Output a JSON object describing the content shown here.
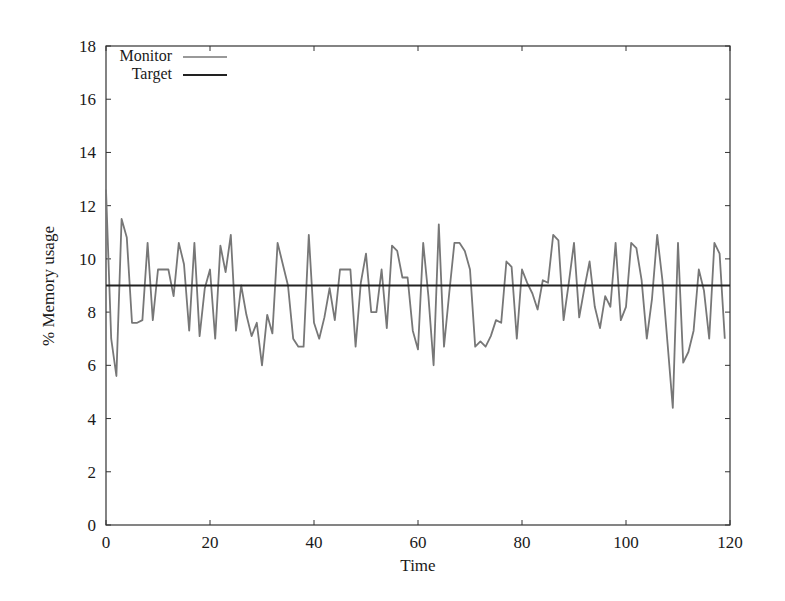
{
  "chart_data": {
    "type": "line",
    "title": "",
    "xlabel": "Time",
    "ylabel": "% Memory usage",
    "xlim": [
      0,
      120
    ],
    "ylim": [
      0,
      18
    ],
    "xticks": [
      0,
      20,
      40,
      60,
      80,
      100,
      120
    ],
    "yticks": [
      0,
      2,
      4,
      6,
      8,
      10,
      12,
      14,
      16,
      18
    ],
    "grid": false,
    "legend_position": "top-left",
    "series": [
      {
        "name": "Monitor",
        "color": "#777777",
        "x": [
          0,
          1,
          2,
          3,
          4,
          5,
          6,
          7,
          8,
          9,
          10,
          11,
          12,
          13,
          14,
          15,
          16,
          17,
          18,
          19,
          20,
          21,
          22,
          23,
          24,
          25,
          26,
          27,
          28,
          29,
          30,
          31,
          32,
          33,
          34,
          35,
          36,
          37,
          38,
          39,
          40,
          41,
          42,
          43,
          44,
          45,
          46,
          47,
          48,
          49,
          50,
          51,
          52,
          53,
          54,
          55,
          56,
          57,
          58,
          59,
          60,
          61,
          62,
          63,
          64,
          65,
          66,
          67,
          68,
          69,
          70,
          71,
          72,
          73,
          74,
          75,
          76,
          77,
          78,
          79,
          80,
          81,
          82,
          83,
          84,
          85,
          86,
          87,
          88,
          89,
          90,
          91,
          92,
          93,
          94,
          95,
          96,
          97,
          98,
          99,
          100,
          101,
          102,
          103,
          104,
          105,
          106,
          107,
          108,
          109,
          110,
          111,
          112,
          113,
          114,
          115,
          116,
          117,
          118,
          119
        ],
        "values": [
          12.6,
          7.0,
          5.6,
          11.5,
          10.8,
          7.6,
          7.6,
          7.7,
          10.6,
          7.7,
          9.6,
          9.6,
          9.6,
          8.6,
          10.6,
          9.8,
          7.3,
          10.6,
          7.1,
          8.9,
          9.6,
          7.0,
          10.5,
          9.5,
          10.9,
          7.3,
          9.0,
          7.9,
          7.1,
          7.6,
          6.0,
          7.9,
          7.2,
          10.6,
          9.8,
          9.0,
          7.0,
          6.7,
          6.7,
          10.9,
          7.6,
          7.0,
          7.8,
          8.9,
          7.7,
          9.6,
          9.6,
          9.6,
          6.7,
          9.1,
          10.2,
          8.0,
          8.0,
          9.6,
          7.4,
          10.5,
          10.3,
          9.3,
          9.3,
          7.3,
          6.6,
          10.6,
          8.6,
          6.0,
          11.3,
          6.7,
          8.7,
          10.6,
          10.6,
          10.3,
          9.6,
          6.7,
          6.9,
          6.7,
          7.1,
          7.7,
          7.6,
          9.9,
          9.7,
          7.0,
          9.6,
          9.1,
          8.7,
          8.1,
          9.2,
          9.1,
          10.9,
          10.7,
          7.7,
          9.1,
          10.6,
          7.8,
          8.9,
          9.9,
          8.2,
          7.4,
          8.6,
          8.2,
          10.6,
          7.7,
          8.2,
          10.6,
          10.4,
          9.2,
          7.0,
          8.5,
          10.9,
          9.2,
          6.8,
          4.4,
          10.6,
          6.1,
          6.5,
          7.3,
          9.6,
          8.8,
          7.0,
          10.6,
          10.2,
          7.0
        ]
      },
      {
        "name": "Target",
        "color": "#222222",
        "x": [
          0,
          120
        ],
        "values": [
          9,
          9
        ]
      }
    ]
  },
  "legend": {
    "items": [
      {
        "label": "Monitor",
        "color": "#777777"
      },
      {
        "label": "Target",
        "color": "#222222"
      }
    ]
  },
  "axes": {
    "x_label": "Time",
    "y_label": "% Memory usage",
    "x_tick_labels": [
      "0",
      "20",
      "40",
      "60",
      "80",
      "100",
      "120"
    ],
    "y_tick_labels": [
      "0",
      "2",
      "4",
      "6",
      "8",
      "10",
      "12",
      "14",
      "16",
      "18"
    ]
  }
}
